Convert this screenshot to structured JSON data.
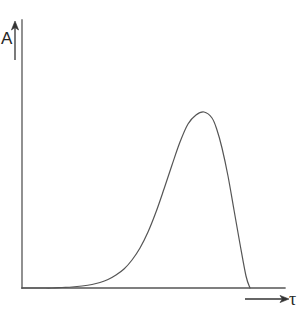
{
  "figure": {
    "title": "",
    "background_color": "#ffffff",
    "line_color": "#555555",
    "text_color": "#262626",
    "width": 306,
    "height": 311
  },
  "axes": {
    "y": {
      "label": "A",
      "label_name": "amplitude",
      "arrow_direction": "up",
      "line": {
        "x": 22,
        "y_top": 20,
        "y_bottom": 288
      },
      "arrow": {
        "x": 15,
        "y_top": 24,
        "y_bottom": 60
      }
    },
    "x": {
      "label": "τ",
      "label_name": "tau",
      "arrow_direction": "right",
      "line": {
        "y": 288,
        "x_left": 22,
        "x_right": 285
      },
      "arrow": {
        "y": 299,
        "x_left": 245,
        "x_right": 288
      }
    }
  },
  "chart_data": {
    "type": "line",
    "title": "",
    "xlabel": "τ",
    "ylabel": "A",
    "grid": false,
    "legend": null,
    "axis_ticks": {
      "x": [],
      "y": []
    },
    "xlim": [
      0,
      263
    ],
    "ylim": [
      0,
      268
    ],
    "series": [
      {
        "name": "response",
        "comment": "Points in plot-pixel space: x measured from the y-axis at px 22, y measured upward from the baseline at px 288.",
        "x": [
          0,
          10,
          20,
          30,
          40,
          50,
          60,
          70,
          78,
          86,
          94,
          102,
          110,
          118,
          126,
          134,
          142,
          150,
          158,
          166,
          174,
          182,
          190,
          195,
          200,
          206,
          212,
          218,
          224,
          228
        ],
        "y": [
          0,
          0,
          0,
          0,
          0.5,
          1,
          2,
          3.5,
          5.5,
          8.5,
          13,
          19,
          28,
          40,
          56,
          76,
          99,
          123,
          146,
          164,
          173,
          176,
          170,
          158,
          140,
          112,
          78,
          44,
          12,
          0
        ]
      }
    ],
    "peak": {
      "x": 195,
      "y": 176,
      "pixel_x": 217,
      "pixel_y": 112
    },
    "baseline_crossing": {
      "x": 228,
      "pixel_x": 250
    }
  }
}
